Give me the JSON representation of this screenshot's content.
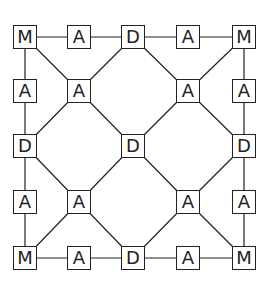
{
  "diagram": {
    "title": "",
    "line_color": "#222222",
    "nodes": [
      {
        "id": "r0c0",
        "label": "M",
        "x": 25,
        "y": 37
      },
      {
        "id": "r0c1",
        "label": "A",
        "x": 79,
        "y": 37
      },
      {
        "id": "r0c2",
        "label": "D",
        "x": 133,
        "y": 37
      },
      {
        "id": "r0c3",
        "label": "A",
        "x": 188,
        "y": 37
      },
      {
        "id": "r0c4",
        "label": "M",
        "x": 244,
        "y": 37
      },
      {
        "id": "r1c0",
        "label": "A",
        "x": 25,
        "y": 91
      },
      {
        "id": "r1c1",
        "label": "A",
        "x": 79,
        "y": 91
      },
      {
        "id": "r1c3",
        "label": "A",
        "x": 188,
        "y": 91
      },
      {
        "id": "r1c4",
        "label": "A",
        "x": 244,
        "y": 91
      },
      {
        "id": "r2c0",
        "label": "D",
        "x": 25,
        "y": 146
      },
      {
        "id": "r2c2",
        "label": "D",
        "x": 133,
        "y": 146
      },
      {
        "id": "r2c4",
        "label": "D",
        "x": 244,
        "y": 146
      },
      {
        "id": "r3c0",
        "label": "A",
        "x": 25,
        "y": 202
      },
      {
        "id": "r3c1",
        "label": "A",
        "x": 79,
        "y": 202
      },
      {
        "id": "r3c3",
        "label": "A",
        "x": 188,
        "y": 202
      },
      {
        "id": "r3c4",
        "label": "A",
        "x": 244,
        "y": 202
      },
      {
        "id": "r4c0",
        "label": "M",
        "x": 25,
        "y": 258
      },
      {
        "id": "r4c1",
        "label": "A",
        "x": 79,
        "y": 258
      },
      {
        "id": "r4c2",
        "label": "D",
        "x": 133,
        "y": 258
      },
      {
        "id": "r4c3",
        "label": "A",
        "x": 188,
        "y": 258
      },
      {
        "id": "r4c4",
        "label": "M",
        "x": 244,
        "y": 258
      }
    ],
    "edges": [
      [
        "r0c0",
        "r0c1"
      ],
      [
        "r0c1",
        "r0c2"
      ],
      [
        "r0c2",
        "r0c3"
      ],
      [
        "r0c3",
        "r0c4"
      ],
      [
        "r4c0",
        "r4c1"
      ],
      [
        "r4c1",
        "r4c2"
      ],
      [
        "r4c2",
        "r4c3"
      ],
      [
        "r4c3",
        "r4c4"
      ],
      [
        "r0c0",
        "r1c0"
      ],
      [
        "r1c0",
        "r2c0"
      ],
      [
        "r2c0",
        "r3c0"
      ],
      [
        "r3c0",
        "r4c0"
      ],
      [
        "r0c4",
        "r1c4"
      ],
      [
        "r1c4",
        "r2c4"
      ],
      [
        "r2c4",
        "r3c4"
      ],
      [
        "r3c4",
        "r4c4"
      ],
      [
        "r0c0",
        "r1c1"
      ],
      [
        "r0c2",
        "r1c1"
      ],
      [
        "r2c0",
        "r1c1"
      ],
      [
        "r2c2",
        "r1c1"
      ],
      [
        "r0c4",
        "r1c3"
      ],
      [
        "r0c2",
        "r1c3"
      ],
      [
        "r2c4",
        "r1c3"
      ],
      [
        "r2c2",
        "r1c3"
      ],
      [
        "r4c0",
        "r3c1"
      ],
      [
        "r4c2",
        "r3c1"
      ],
      [
        "r2c0",
        "r3c1"
      ],
      [
        "r2c2",
        "r3c1"
      ],
      [
        "r4c4",
        "r3c3"
      ],
      [
        "r4c2",
        "r3c3"
      ],
      [
        "r2c4",
        "r3c3"
      ],
      [
        "r2c2",
        "r3c3"
      ]
    ]
  },
  "caption": "Figure caption (partially visible, cut off)"
}
